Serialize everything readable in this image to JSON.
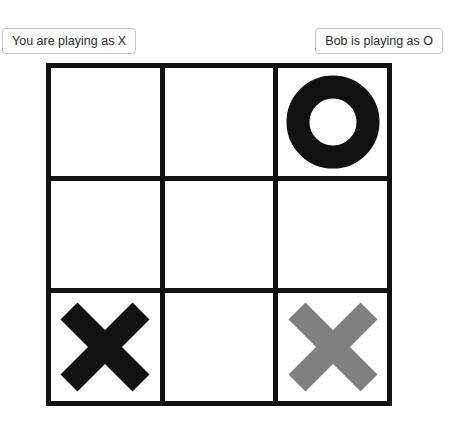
{
  "status_bar": {
    "you": {
      "label": "You are playing as X",
      "symbol": "X"
    },
    "opponent": {
      "label": "Bob is playing as O",
      "name": "Bob",
      "symbol": "O"
    }
  },
  "board": {
    "rows": 3,
    "columns": 3,
    "grid_color": "#111111",
    "cell_background": "#ffffff",
    "cells": [
      {
        "position": "top-left",
        "mark": "empty",
        "color": "",
        "state": "empty"
      },
      {
        "position": "top-center",
        "mark": "empty",
        "color": "",
        "state": "empty"
      },
      {
        "position": "top-right",
        "mark": "O",
        "color": "#111111",
        "state": "placed"
      },
      {
        "position": "middle-left",
        "mark": "empty",
        "color": "",
        "state": "empty"
      },
      {
        "position": "middle-center",
        "mark": "empty",
        "color": "",
        "state": "empty"
      },
      {
        "position": "middle-right",
        "mark": "empty",
        "color": "",
        "state": "empty"
      },
      {
        "position": "bottom-left",
        "mark": "X",
        "color": "#111111",
        "state": "placed"
      },
      {
        "position": "bottom-center",
        "mark": "empty",
        "color": "",
        "state": "empty"
      },
      {
        "position": "bottom-right",
        "mark": "X",
        "color": "#808080",
        "state": "preview"
      }
    ]
  },
  "colors": {
    "mark_placed": "#111111",
    "mark_preview": "#808080",
    "chip_border": "#c4c4c4",
    "chip_text": "#2b2b2b",
    "background": "#ffffff"
  }
}
